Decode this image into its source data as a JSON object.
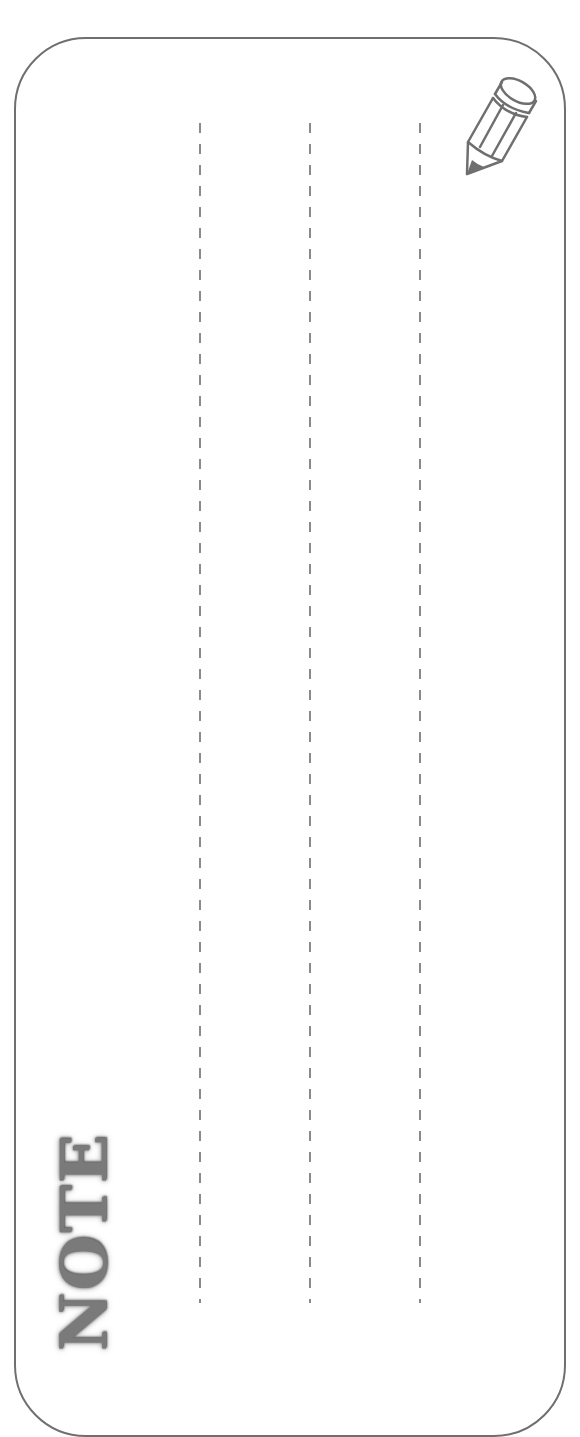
{
  "card": {
    "title": "NOTE",
    "border_color": "#6f6f6f",
    "line_color": "#8a8a8a",
    "line_count": 3,
    "icon": "pencil-icon"
  }
}
